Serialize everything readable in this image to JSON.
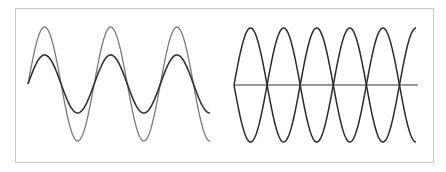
{
  "figure": {
    "panels": [
      {
        "name": "amplitude-comparison",
        "description": "Two in-phase sine waves of different amplitude",
        "x_start": 28,
        "x_end": 210,
        "baseline_y": 84,
        "periods": 2.75,
        "series": [
          {
            "name": "large-amplitude-wave",
            "amplitude_px": 57,
            "color": "#7a7a7a",
            "width": 1.3
          },
          {
            "name": "small-amplitude-wave",
            "amplitude_px": 29,
            "color": "#333333",
            "width": 1.6
          }
        ]
      },
      {
        "name": "antiphase-comparison",
        "description": "Two sine waves 180 degrees out of phase with a horizontal axis",
        "x_start": 234,
        "x_end": 416,
        "baseline_y": 85,
        "periods": 2.75,
        "axis": {
          "x_end": 418,
          "color": "#777777"
        },
        "series": [
          {
            "name": "wave-positive",
            "amplitude_px": 57,
            "sign": 1,
            "color": "#2a2a2a",
            "width": 1.5
          },
          {
            "name": "wave-negative",
            "amplitude_px": 57,
            "sign": -1,
            "color": "#2a2a2a",
            "width": 1.5
          }
        ]
      }
    ],
    "frame_border_color": "#c8c8c8"
  }
}
